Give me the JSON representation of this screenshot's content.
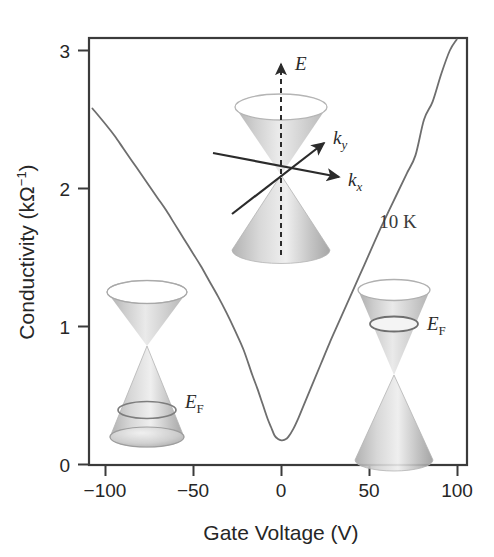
{
  "figure": {
    "background_color": "#ffffff",
    "frame_color": "#3b3b3b",
    "curve_color": "#6e6e6e",
    "cone_color": "#b9b9b9"
  },
  "annotations": {
    "temperature": "10 K",
    "fermi_left": {
      "symbol": "E",
      "subscript": "F"
    },
    "fermi_right": {
      "symbol": "E",
      "subscript": "F"
    }
  },
  "inset": {
    "energy_axis": "E",
    "kx_axis": {
      "symbol": "k",
      "subscript": "x"
    },
    "ky_axis": {
      "symbol": "k",
      "subscript": "y"
    }
  },
  "chart_data": {
    "type": "line",
    "title": "",
    "xlabel": "Gate Voltage (V)",
    "ylabel_text": "Conductivity (k",
    "ylabel_unit": "Ω",
    "ylabel_exp": "−1",
    "ylabel_close": ")",
    "ylabel": "Conductivity (kΩ−1)",
    "xlim": [
      -110,
      110
    ],
    "ylim": [
      0,
      3.15
    ],
    "xticks": [
      -100,
      -50,
      0,
      50,
      100
    ],
    "xtick_labels": [
      "−100",
      "−50",
      "0",
      "50",
      "100"
    ],
    "yticks": [
      0,
      1,
      2,
      3
    ],
    "ytick_labels": [
      "0",
      "1",
      "2",
      "3"
    ],
    "grid": false,
    "legend": "none",
    "series": [
      {
        "name": "Conductivity at 10 K",
        "x": [
          -108,
          -100,
          -95,
          -90,
          -85,
          -80,
          -75,
          -70,
          -65,
          -60,
          -55,
          -50,
          -45,
          -40,
          -35,
          -30,
          -25,
          -20,
          -15,
          -12,
          -9,
          -6,
          -4,
          -2,
          0,
          2,
          4,
          6,
          9,
          12,
          15,
          20,
          25,
          30,
          35,
          40,
          45,
          50,
          55,
          60,
          65,
          70,
          75,
          80,
          85,
          90,
          95,
          100,
          104
        ],
        "y": [
          2.58,
          2.46,
          2.38,
          2.29,
          2.2,
          2.11,
          2.02,
          1.93,
          1.84,
          1.74,
          1.64,
          1.54,
          1.44,
          1.33,
          1.22,
          1.1,
          0.97,
          0.83,
          0.65,
          0.55,
          0.44,
          0.33,
          0.27,
          0.21,
          0.185,
          0.175,
          0.18,
          0.2,
          0.26,
          0.34,
          0.43,
          0.58,
          0.73,
          0.88,
          1.02,
          1.16,
          1.3,
          1.44,
          1.58,
          1.72,
          1.85,
          1.98,
          2.11,
          2.24,
          2.5,
          2.63,
          2.83,
          3.0,
          3.08
        ]
      }
    ],
    "minimum_point": {
      "x": 1,
      "y": 0.175
    }
  }
}
